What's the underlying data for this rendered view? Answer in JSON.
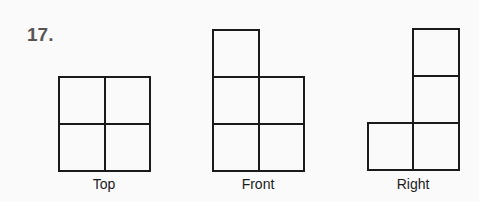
{
  "problem": {
    "number": "17."
  },
  "views": [
    {
      "name": "top",
      "label": "Top"
    },
    {
      "name": "front",
      "label": "Front"
    },
    {
      "name": "right",
      "label": "Right"
    }
  ]
}
